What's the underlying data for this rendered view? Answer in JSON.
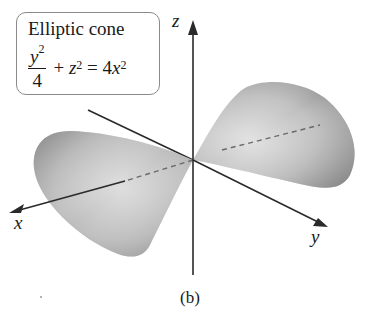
{
  "label_box": {
    "title": "Elliptic cone",
    "equation": {
      "numerator": "y",
      "numerator_exp": "2",
      "denominator": "4",
      "plus": "+",
      "z": "z",
      "z_exp": "2",
      "equals": "=",
      "rhs_coef": "4",
      "rhs_var": "x",
      "rhs_exp": "2"
    }
  },
  "axes": {
    "x_label": "x",
    "y_label": "y",
    "z_label": "z"
  },
  "caption": "(b)",
  "colors": {
    "axis": "#2a2a2a",
    "surface_light": "#d8d8d8",
    "surface_dark": "#8c8c8c",
    "box_border": "#8a8a8a"
  }
}
